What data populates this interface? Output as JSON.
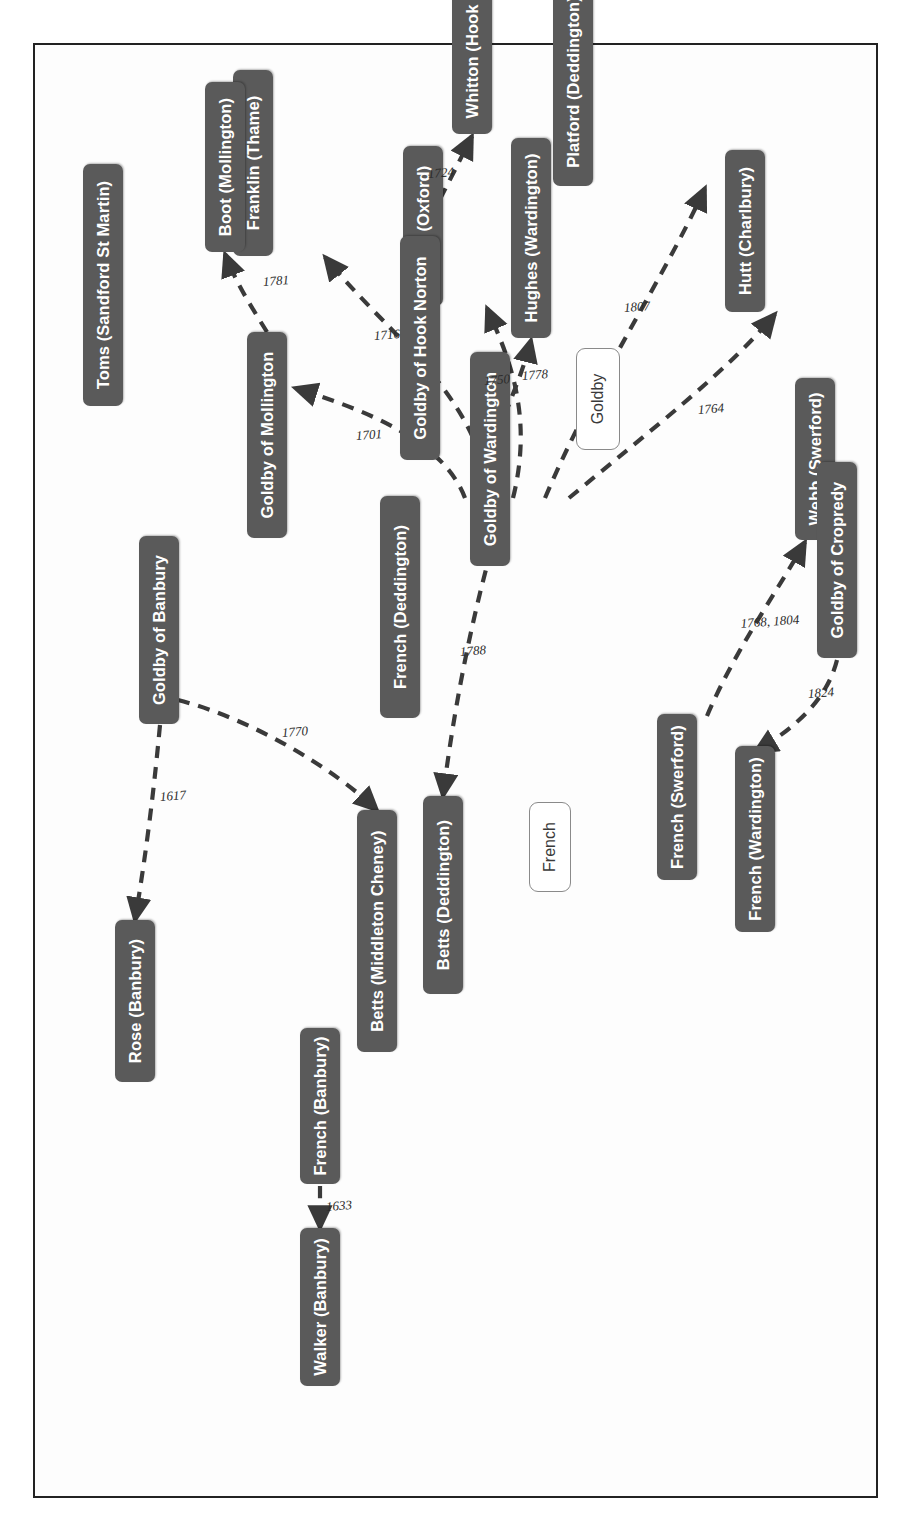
{
  "diagram": {
    "type": "family-network-diagram",
    "orientation": "rotated-90-ccw",
    "node_fill": "#5a5a5a",
    "node_text": "#ffffff",
    "edge_color": "#3a3a3a",
    "frame_color": "#222222"
  },
  "legends": [
    {
      "id": "legend-french",
      "label": "French"
    },
    {
      "id": "legend-goldby",
      "label": "Goldby"
    }
  ],
  "nodes": [
    {
      "id": "n-toms",
      "label": "Toms (Sandford St Martin)"
    },
    {
      "id": "n-franklin",
      "label": "Franklin (Thame)"
    },
    {
      "id": "n-hanks",
      "label": "Hanks (Oxford)"
    },
    {
      "id": "n-platford",
      "label": "Platford (Deddington)"
    },
    {
      "id": "n-hutt",
      "label": "Hutt (Charlbury)"
    },
    {
      "id": "n-webb",
      "label": "Webb (Swerford)"
    },
    {
      "id": "n-french-deddington",
      "label": "French (Deddington)"
    },
    {
      "id": "n-french-swerford",
      "label": "French (Swerford)"
    },
    {
      "id": "n-french-wardington",
      "label": "French (Wardington)"
    },
    {
      "id": "n-french-banbury",
      "label": "French (Banbury)"
    },
    {
      "id": "n-walker",
      "label": "Walker (Banbury)"
    },
    {
      "id": "n-betts-middleton",
      "label": "Betts (Middleton Cheney)"
    },
    {
      "id": "n-betts-deddington",
      "label": "Betts (Deddington)"
    },
    {
      "id": "n-rose",
      "label": "Rose (Banbury)"
    },
    {
      "id": "n-goldby-banbury",
      "label": "Goldby of Banbury"
    },
    {
      "id": "n-goldby-cropredy",
      "label": "Goldby of Cropredy"
    },
    {
      "id": "n-goldby-wardington",
      "label": "Goldby of Wardington"
    },
    {
      "id": "n-hughes",
      "label": "Hughes (Wardington)"
    },
    {
      "id": "n-goldby-mollington",
      "label": "Goldby of Mollington"
    },
    {
      "id": "n-boot",
      "label": "Boot (Mollington)"
    },
    {
      "id": "n-goldby-hooknorton",
      "label": "Goldby of Hook Norton"
    },
    {
      "id": "n-whitton",
      "label": "Whitton (Hook Norton)"
    }
  ],
  "edges": [
    {
      "id": "e-1701",
      "from": "n-french-deddington",
      "to": "n-toms",
      "label": "1701"
    },
    {
      "id": "e-1716",
      "from": "n-french-deddington",
      "to": "n-franklin",
      "label": "1716"
    },
    {
      "id": "e-1778",
      "from": "n-french-deddington",
      "to": "n-hanks",
      "label": "1778"
    },
    {
      "id": "e-1807",
      "from": "n-french-deddington",
      "to": "n-platford",
      "label": "1807"
    },
    {
      "id": "e-1764",
      "from": "n-french-deddington",
      "to": "n-hutt",
      "label": "1764"
    },
    {
      "id": "e-1788",
      "from": "n-french-deddington",
      "to": "n-betts-deddington",
      "label": "1788"
    },
    {
      "id": "e-1633",
      "from": "n-french-banbury",
      "to": "n-walker",
      "label": "1633"
    },
    {
      "id": "e-1768-1804",
      "from": "n-french-swerford",
      "to": "n-webb",
      "label": "1768, 1804"
    },
    {
      "id": "e-1824",
      "from": "n-goldby-cropredy",
      "to": "n-french-wardington",
      "label": "1824"
    },
    {
      "id": "e-1617",
      "from": "n-goldby-banbury",
      "to": "n-rose",
      "label": "1617"
    },
    {
      "id": "e-1770",
      "from": "n-goldby-banbury",
      "to": "n-betts-middleton",
      "label": "1770"
    },
    {
      "id": "e-1750",
      "from": "n-goldby-wardington",
      "to": "n-hughes",
      "label": "1750"
    },
    {
      "id": "e-1781",
      "from": "n-goldby-mollington",
      "to": "n-boot",
      "label": "1781"
    },
    {
      "id": "e-1724",
      "from": "n-goldby-hooknorton",
      "to": "n-whitton",
      "label": "1724"
    }
  ]
}
